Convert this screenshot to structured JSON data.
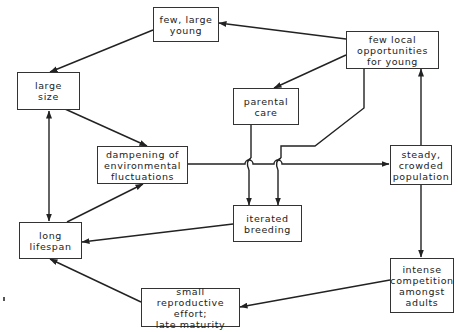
{
  "diagram": {
    "type": "flow diagram",
    "nodes": [
      {
        "id": "few_large_young",
        "label": "few, large\nyoung"
      },
      {
        "id": "few_local_opps",
        "label": "few local\nopportunities\nfor young"
      },
      {
        "id": "large_size",
        "label": "large\nsize"
      },
      {
        "id": "parental_care",
        "label": "parental\ncare"
      },
      {
        "id": "dampening",
        "label": "dampening of\nenvironmental\nfluctuations"
      },
      {
        "id": "steady_crowded",
        "label": "steady,\ncrowded\npopulation"
      },
      {
        "id": "iterated_breeding",
        "label": "iterated\nbreeding"
      },
      {
        "id": "long_lifespan",
        "label": "long\nlifespan"
      },
      {
        "id": "intense_competition",
        "label": "intense\ncompetition\namongst\nadults"
      },
      {
        "id": "small_repro",
        "label": "small reproductive\neffort;\nlate maturity"
      }
    ],
    "edges": [
      {
        "from": "few_local_opps",
        "to": "few_large_young"
      },
      {
        "from": "few_large_young",
        "to": "large_size"
      },
      {
        "from": "few_local_opps",
        "to": "parental_care"
      },
      {
        "from": "few_local_opps",
        "to": "iterated_breeding"
      },
      {
        "from": "parental_care",
        "to": "iterated_breeding"
      },
      {
        "from": "large_size",
        "to": "dampening"
      },
      {
        "from": "dampening",
        "to": "steady_crowded"
      },
      {
        "from": "steady_crowded",
        "to": "few_local_opps"
      },
      {
        "from": "steady_crowded",
        "to": "intense_competition"
      },
      {
        "from": "intense_competition",
        "to": "small_repro"
      },
      {
        "from": "small_repro",
        "to": "long_lifespan"
      },
      {
        "from": "iterated_breeding",
        "to": "long_lifespan"
      },
      {
        "from": "long_lifespan",
        "to": "dampening"
      },
      {
        "from": "large_size",
        "to": "long_lifespan",
        "bidirectional": true
      }
    ]
  }
}
